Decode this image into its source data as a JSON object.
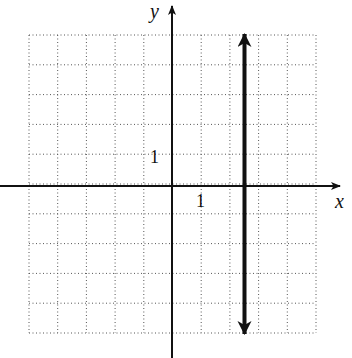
{
  "chart_data": {
    "type": "line",
    "title": "",
    "xlabel": "x",
    "ylabel": "y",
    "xlim": [
      -5,
      5
    ],
    "ylim": [
      -5,
      5
    ],
    "grid": true,
    "grid_style": "dotted",
    "tick_labels": {
      "x": [
        "1"
      ],
      "y": [
        "1"
      ]
    },
    "series": [
      {
        "name": "vertical line",
        "equation": "x = 2.5",
        "x": [
          2.5,
          2.5
        ],
        "y": [
          -5,
          5
        ],
        "arrows": "both ends"
      }
    ]
  },
  "labels": {
    "x_axis": "x",
    "y_axis": "y",
    "x_tick": "1",
    "y_tick": "1"
  },
  "colors": {
    "axis": "#111111",
    "grid": "#555555",
    "line": "#111111"
  }
}
